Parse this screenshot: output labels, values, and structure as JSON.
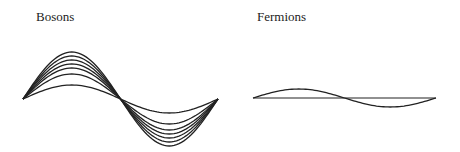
{
  "panels": [
    {
      "title": "Bosons",
      "title_pos": [
        36,
        9
      ],
      "x_start": 23,
      "x_end": 218,
      "axis_y": 99,
      "amplitudes": [
        47,
        43,
        39,
        35,
        31,
        25,
        14
      ],
      "show_axis": false,
      "color": "#222222"
    },
    {
      "title": "Fermions",
      "title_pos": [
        257,
        9
      ],
      "x_start": 253,
      "x_end": 436,
      "axis_y": 98,
      "amplitudes": [
        9
      ],
      "show_axis": true,
      "color": "#222222"
    }
  ]
}
